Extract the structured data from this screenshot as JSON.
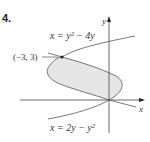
{
  "problem_number": "4.",
  "figure": {
    "axis_x_label": "x",
    "axis_y_label": "y",
    "curve_top_label": "x = y² − 4y",
    "curve_bottom_label": "x = 2y − y²",
    "point_label": "(−3, 3)",
    "region_fill": "#e6e6e6",
    "curve_color": "#555555"
  }
}
